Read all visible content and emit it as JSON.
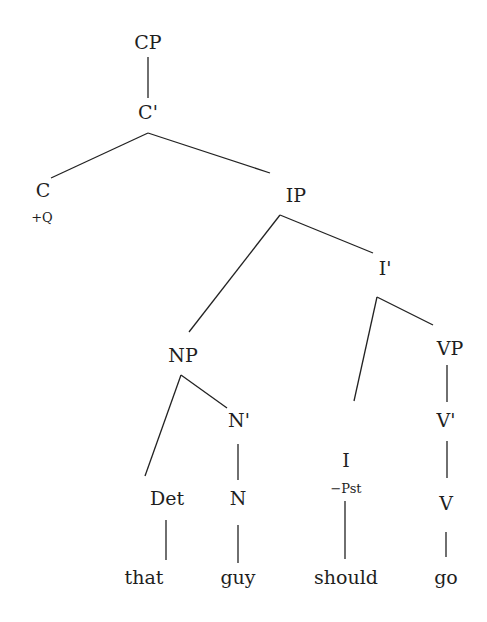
{
  "diagram": {
    "type": "syntax-tree",
    "nodes": {
      "cp": "CP",
      "c_bar": "C'",
      "c": "C",
      "c_feature": "+Q",
      "ip": "IP",
      "i_bar": "I'",
      "np": "NP",
      "vp": "VP",
      "n_bar": "N'",
      "v_bar": "V'",
      "det": "Det",
      "n": "N",
      "i": "I",
      "i_feature": "−Pst",
      "v": "V"
    },
    "leaves": {
      "that": "that",
      "guy": "guy",
      "should": "should",
      "go": "go"
    },
    "edges": [
      [
        "CP",
        "C'"
      ],
      [
        "C'",
        "C"
      ],
      [
        "C'",
        "IP"
      ],
      [
        "IP",
        "NP"
      ],
      [
        "IP",
        "I'"
      ],
      [
        "I'",
        "I"
      ],
      [
        "I'",
        "VP"
      ],
      [
        "NP",
        "Det"
      ],
      [
        "NP",
        "N'"
      ],
      [
        "N'",
        "N"
      ],
      [
        "VP",
        "V'"
      ],
      [
        "V'",
        "V"
      ],
      [
        "Det",
        "that"
      ],
      [
        "N",
        "guy"
      ],
      [
        "I",
        "should"
      ],
      [
        "V",
        "go"
      ]
    ],
    "colors": {
      "text": "#1e1e1e",
      "lines": "#222222",
      "background": "#ffffff"
    }
  }
}
